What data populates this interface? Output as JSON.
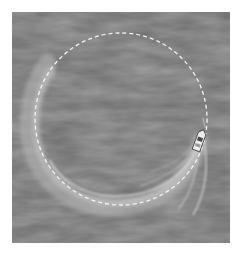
{
  "image": {
    "description": "Aerial view of a speedboat turning on dark water, leaving a circular white wake, with a dashed white circle overlay",
    "colors": {
      "background": "#ffffff",
      "water": "#6e6e6e",
      "water_dark": "#5a5a5a",
      "water_light": "#848484",
      "wake": "#c8c8c8",
      "dashed_circle": "#f2f2f2",
      "boat": "#e8e8e8"
    },
    "water_rect": {
      "x": 12,
      "y": 12,
      "width": 218,
      "height": 231
    },
    "dashed_circle": {
      "cx": 121,
      "cy": 119,
      "r": 86
    },
    "boat": {
      "x": 199,
      "y": 140,
      "rotation": 20
    }
  }
}
